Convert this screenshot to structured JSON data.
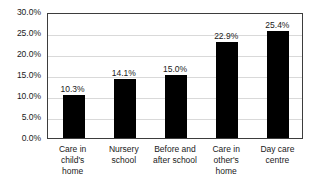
{
  "chart_data": {
    "type": "bar",
    "title": "",
    "subtitle": "",
    "xlabel": "",
    "ylabel": "",
    "ylim": [
      0,
      30
    ],
    "grid": true,
    "legend": false,
    "legend_position": "none",
    "bar_color": "#000000",
    "gridline_color": "#d9d9d9",
    "frame_color": "#3d3d3d",
    "categories": [
      "Care in child's home",
      "Nursery school",
      "Before and after school",
      "Care in other's home",
      "Day care centre"
    ],
    "category_lines": [
      [
        "Care in",
        "child's",
        "home"
      ],
      [
        "Nursery",
        "school"
      ],
      [
        "Before and",
        "after school"
      ],
      [
        "Care in",
        "other's",
        "home"
      ],
      [
        "Day care",
        "centre"
      ]
    ],
    "values": [
      10.3,
      14.1,
      15.0,
      22.9,
      25.4
    ],
    "data_labels": [
      "10.3%",
      "14.1%",
      "15.0%",
      "22.9%",
      "25.4%"
    ],
    "yticks": [
      0,
      5,
      10,
      15,
      20,
      25,
      30
    ],
    "ytick_labels": [
      "0.0%",
      "5.0%",
      "10.0%",
      "15.0%",
      "20.0%",
      "25.0%",
      "30.0%"
    ]
  }
}
